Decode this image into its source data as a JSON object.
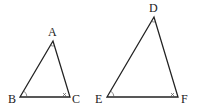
{
  "figure": {
    "colors": {
      "stroke": "#222222",
      "mark": "#555555",
      "background": "#ffffff"
    },
    "triangles": [
      {
        "name": "ABC",
        "vertices": [
          {
            "label": "A",
            "x": 53,
            "y": 41,
            "label_x": 52,
            "label_y": 36
          },
          {
            "label": "B",
            "x": 20,
            "y": 97,
            "label_x": 13,
            "label_y": 103
          },
          {
            "label": "C",
            "x": 70,
            "y": 97,
            "label_x": 77,
            "label_y": 103
          }
        ],
        "angle_marks": {
          "A": "arc",
          "B": "arc",
          "C": "cross"
        }
      },
      {
        "name": "DEF",
        "vertices": [
          {
            "label": "D",
            "x": 154,
            "y": 17,
            "label_x": 153,
            "label_y": 12
          },
          {
            "label": "E",
            "x": 107,
            "y": 97,
            "label_x": 100,
            "label_y": 103
          },
          {
            "label": "F",
            "x": 178,
            "y": 97,
            "label_x": 186,
            "label_y": 103
          }
        ],
        "angle_marks": {
          "D": "arc",
          "E": "arc",
          "F": "cross"
        }
      }
    ]
  }
}
